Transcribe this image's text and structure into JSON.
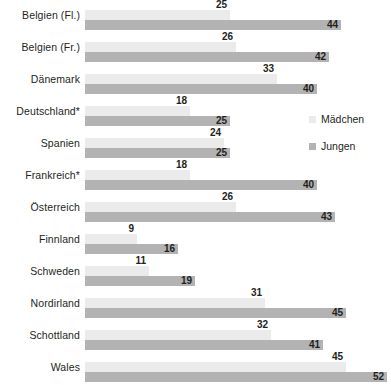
{
  "chart_data": {
    "type": "bar",
    "orientation": "horizontal",
    "title": "",
    "subtitle": "",
    "xlabel": "",
    "ylabel": "",
    "xlim": [
      0,
      52
    ],
    "grid": false,
    "legend_position": "right",
    "categories": [
      "Belgien (Fl.)",
      "Belgien (Fr.)",
      "Dänemark",
      "Deutschland*",
      "Spanien",
      "Frankreich*",
      "Österreich",
      "Finnland",
      "Schweden",
      "Nordirland",
      "Schottland",
      "Wales"
    ],
    "series": [
      {
        "name": "Mädchen",
        "color": "#ebebeb",
        "values": [
          25,
          26,
          33,
          18,
          24,
          18,
          26,
          9,
          11,
          31,
          32,
          45
        ]
      },
      {
        "name": "Jungen",
        "color": "#b3b3b3",
        "values": [
          44,
          42,
          40,
          25,
          25,
          40,
          43,
          16,
          19,
          45,
          41,
          52
        ]
      }
    ]
  },
  "legend": {
    "items": [
      {
        "label": "Mädchen",
        "swatch": "#ebebeb"
      },
      {
        "label": "Jungen",
        "swatch": "#b3b3b3"
      }
    ]
  }
}
